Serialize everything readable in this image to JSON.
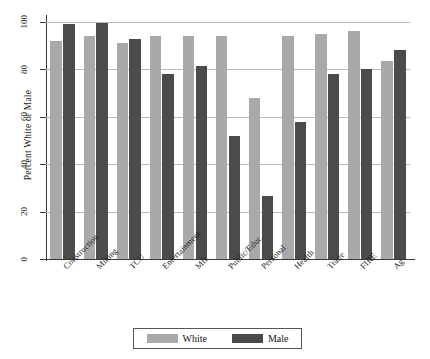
{
  "chart_data": {
    "type": "bar",
    "title": "",
    "xlabel": "",
    "ylabel": "Percent White or Male",
    "ylim": [
      0,
      100
    ],
    "yticks": [
      0,
      20,
      40,
      60,
      80,
      100
    ],
    "grid": true,
    "legend_position": "bottom",
    "categories": [
      "Construction",
      "Mining",
      "TCU",
      "Entertainment",
      "Mft",
      "Public/Educ.",
      "Personal",
      "Health",
      "Trade",
      "FIRE",
      "Ag"
    ],
    "series": [
      {
        "name": "White",
        "color": "#a9a9a9",
        "values": [
          92,
          94,
          91,
          94,
          94,
          94,
          68,
          94,
          95,
          96,
          83.5
        ]
      },
      {
        "name": "Male",
        "color": "#4b4b4b",
        "values": [
          99,
          99.5,
          93,
          78,
          81.5,
          52,
          26.5,
          58,
          78,
          80,
          88
        ]
      }
    ]
  },
  "axis": {
    "y_title": "Percent White or Male",
    "tick_labels": [
      "0",
      "20",
      "40",
      "60",
      "80",
      "100"
    ]
  },
  "legend": {
    "entries": [
      {
        "label": "White",
        "color": "#a9a9a9"
      },
      {
        "label": "Male",
        "color": "#4b4b4b"
      }
    ]
  }
}
